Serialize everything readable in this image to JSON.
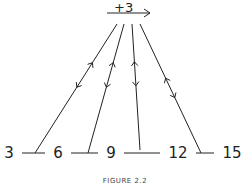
{
  "diagram": {
    "operator_label": "+3",
    "operator_arrow": "right-arrow-icon",
    "numbers": [
      "3",
      "6",
      "9",
      "12",
      "15"
    ],
    "relations": [
      {
        "from": "3",
        "to": "6",
        "directions": [
          "up",
          "down"
        ]
      },
      {
        "from": "6",
        "to": "9",
        "directions": [
          "up",
          "down"
        ]
      },
      {
        "from": "9",
        "to": "12",
        "directions": [
          "up",
          "down"
        ]
      },
      {
        "from": "12",
        "to": "15",
        "directions": [
          "up",
          "down"
        ]
      }
    ],
    "caption": "FIGURE 2.2"
  }
}
